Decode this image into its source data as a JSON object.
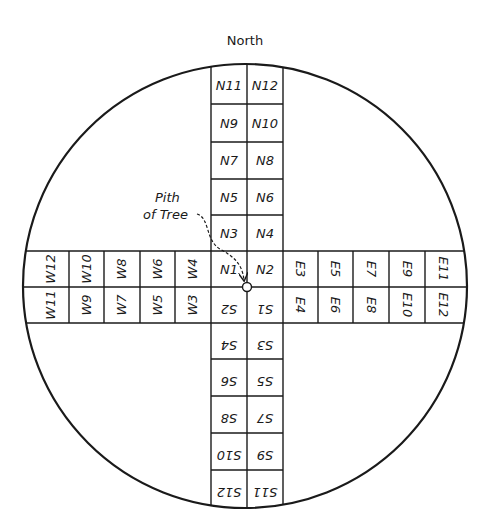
{
  "title": "North",
  "annotation": {
    "line1": "Pith",
    "line2": "of Tree"
  },
  "colors": {
    "ink": "#1a1a1a",
    "background": "#ffffff"
  },
  "north_strip": {
    "rows": [
      [
        "N11",
        "N12"
      ],
      [
        "N9",
        "N10"
      ],
      [
        "N7",
        "N8"
      ],
      [
        "N5",
        "N6"
      ],
      [
        "N3",
        "N4"
      ]
    ]
  },
  "center": {
    "top_left": "N1",
    "top_right": "N2",
    "bottom_left": "S2",
    "bottom_right": "S1"
  },
  "south_strip": {
    "rows": [
      [
        "S4",
        "S3"
      ],
      [
        "S6",
        "S5"
      ],
      [
        "S8",
        "S7"
      ],
      [
        "S10",
        "S9"
      ],
      [
        "S12",
        "S11"
      ]
    ]
  },
  "west_strip": {
    "top": [
      "W12",
      "W10",
      "W8",
      "W6",
      "W4"
    ],
    "bottom": [
      "W11",
      "W9",
      "W7",
      "W5",
      "W3"
    ]
  },
  "east_strip": {
    "top": [
      "E3",
      "E5",
      "E7",
      "E9",
      "E11"
    ],
    "bottom": [
      "E4",
      "E6",
      "E8",
      "E10",
      "E12"
    ]
  }
}
